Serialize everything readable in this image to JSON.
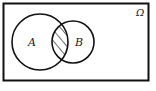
{
  "diagram": {
    "type": "venn",
    "universe_label": "Ω",
    "sets": [
      {
        "name": "A",
        "label": "A"
      },
      {
        "name": "B",
        "label": "B"
      }
    ],
    "shaded_region": "A ∩ B",
    "colors": {
      "stroke": "#111111",
      "background": "#ffffff",
      "hatch": "#222222"
    }
  }
}
